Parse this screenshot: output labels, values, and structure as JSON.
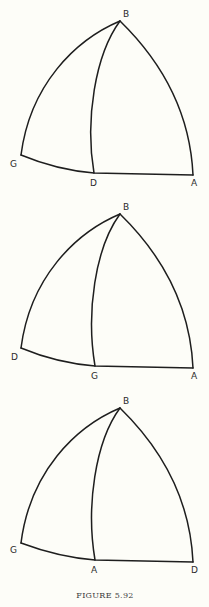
{
  "caption": "FIGURE 5.92",
  "panels": [
    {
      "labels": {
        "apex": "B",
        "left": "G",
        "foot": "D",
        "right": "A"
      },
      "apex": [
        120,
        21
      ],
      "left": [
        21,
        155
      ],
      "foot": [
        94,
        173
      ],
      "right": [
        193,
        175
      ]
    },
    {
      "labels": {
        "apex": "B",
        "left": "D",
        "foot": "G",
        "right": "A"
      },
      "apex": [
        120,
        214
      ],
      "left": [
        21,
        348
      ],
      "foot": [
        95,
        366
      ],
      "right": [
        193,
        368
      ]
    },
    {
      "labels": {
        "apex": "B",
        "left": "G",
        "foot": "A",
        "right": "D"
      },
      "apex": [
        120,
        408
      ],
      "left": [
        21,
        543
      ],
      "foot": [
        95,
        560
      ],
      "right": [
        193,
        562
      ]
    }
  ],
  "colors": {
    "background": "#fdfdf8",
    "stroke": "#1e1e1e"
  }
}
